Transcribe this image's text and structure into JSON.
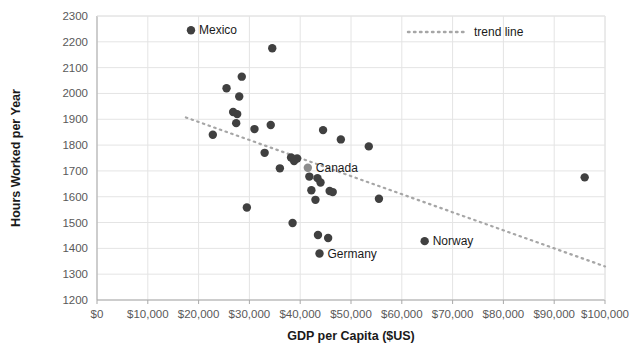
{
  "chart_data": {
    "type": "scatter",
    "title": "",
    "xlabel": "GDP per Capita ($US)",
    "ylabel": "Hours Worked per Year",
    "xlim": [
      0,
      100000
    ],
    "ylim": [
      1200,
      2300
    ],
    "x_ticks": [
      0,
      10000,
      20000,
      30000,
      40000,
      50000,
      60000,
      70000,
      80000,
      90000,
      100000
    ],
    "x_tick_labels": [
      "$0",
      "$10,000",
      "$20,000",
      "$30,000",
      "$40,000",
      "$50,000",
      "$60,000",
      "$70,000",
      "$80,000",
      "$90,000",
      "$100,000"
    ],
    "y_ticks": [
      1200,
      1300,
      1400,
      1500,
      1600,
      1700,
      1800,
      1900,
      2000,
      2100,
      2200,
      2300
    ],
    "y_tick_labels": [
      "1200",
      "1300",
      "1400",
      "1500",
      "1600",
      "1700",
      "1800",
      "1900",
      "2000",
      "2100",
      "2200",
      "2300"
    ],
    "grid": true,
    "legend": {
      "position": "top-right",
      "entries": [
        {
          "label": "trend line",
          "style": "dotted",
          "color": "#a6a6a6"
        }
      ]
    },
    "marker_color": "#404040",
    "highlight_marker_color": "#8c8c8c",
    "series": [
      {
        "name": "Countries",
        "points": [
          {
            "label": "Mexico",
            "x": 18500,
            "y": 2245,
            "labeled": true,
            "label_side": "right"
          },
          {
            "label": "",
            "x": 34500,
            "y": 2175,
            "labeled": false
          },
          {
            "label": "",
            "x": 28500,
            "y": 2065,
            "labeled": false
          },
          {
            "label": "",
            "x": 25500,
            "y": 2020,
            "labeled": false
          },
          {
            "label": "",
            "x": 28000,
            "y": 1988,
            "labeled": false
          },
          {
            "label": "",
            "x": 26800,
            "y": 1928,
            "labeled": false
          },
          {
            "label": "",
            "x": 27600,
            "y": 1920,
            "labeled": false
          },
          {
            "label": "",
            "x": 27400,
            "y": 1885,
            "labeled": false
          },
          {
            "label": "",
            "x": 31000,
            "y": 1862,
            "labeled": false
          },
          {
            "label": "",
            "x": 34200,
            "y": 1878,
            "labeled": false
          },
          {
            "label": "",
            "x": 44500,
            "y": 1858,
            "labeled": false
          },
          {
            "label": "",
            "x": 22800,
            "y": 1840,
            "labeled": false
          },
          {
            "label": "",
            "x": 48000,
            "y": 1822,
            "labeled": false
          },
          {
            "label": "",
            "x": 53500,
            "y": 1795,
            "labeled": false
          },
          {
            "label": "",
            "x": 33000,
            "y": 1770,
            "labeled": false
          },
          {
            "label": "",
            "x": 38200,
            "y": 1752,
            "labeled": false
          },
          {
            "label": "",
            "x": 39400,
            "y": 1748,
            "labeled": false
          },
          {
            "label": "",
            "x": 38800,
            "y": 1738,
            "labeled": false
          },
          {
            "label": "",
            "x": 36000,
            "y": 1710,
            "labeled": false
          },
          {
            "label": "Canada",
            "x": 41500,
            "y": 1712,
            "labeled": true,
            "label_side": "right",
            "highlight": true
          },
          {
            "label": "",
            "x": 41800,
            "y": 1678,
            "labeled": false
          },
          {
            "label": "",
            "x": 43400,
            "y": 1672,
            "labeled": false
          },
          {
            "label": "",
            "x": 44000,
            "y": 1655,
            "labeled": false
          },
          {
            "label": "",
            "x": 42200,
            "y": 1625,
            "labeled": false
          },
          {
            "label": "",
            "x": 45800,
            "y": 1622,
            "labeled": false
          },
          {
            "label": "",
            "x": 46400,
            "y": 1618,
            "labeled": false
          },
          {
            "label": "",
            "x": 55500,
            "y": 1592,
            "labeled": false
          },
          {
            "label": "",
            "x": 43000,
            "y": 1588,
            "labeled": false
          },
          {
            "label": "",
            "x": 29500,
            "y": 1558,
            "labeled": false
          },
          {
            "label": "",
            "x": 38500,
            "y": 1498,
            "labeled": false
          },
          {
            "label": "",
            "x": 43500,
            "y": 1452,
            "labeled": false
          },
          {
            "label": "",
            "x": 45500,
            "y": 1440,
            "labeled": false
          },
          {
            "label": "Norway",
            "x": 64500,
            "y": 1428,
            "labeled": true,
            "label_side": "right"
          },
          {
            "label": "Germany",
            "x": 43800,
            "y": 1380,
            "labeled": true,
            "label_side": "right"
          },
          {
            "label": "",
            "x": 96000,
            "y": 1675,
            "labeled": false
          }
        ]
      }
    ],
    "trend_line": {
      "name": "trend line",
      "x_start": 17500,
      "y_start": 1907,
      "x_end": 100000,
      "y_end": 1330,
      "style": "dotted",
      "color": "#a6a6a6"
    }
  }
}
